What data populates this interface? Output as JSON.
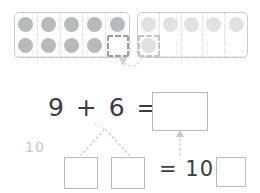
{
  "worksheet": {
    "title": "Make-a-ten strategy worksheet",
    "background_color": "#ffffff"
  },
  "colors": {
    "chip_dark": "#b7babd",
    "chip_light": "#dfe1e3",
    "frame_border": "#c9cccf",
    "grid_line": "#d7d9dc",
    "dashed_highlight": "#9b9ea1",
    "text": "#363b3e",
    "faint_label": "#c6c8cb",
    "connector": "#d2d4d7"
  },
  "ten_frames": [
    {
      "name": "left-ten-frame",
      "filled_count": 9,
      "capacity": 10,
      "chip_shade": "dark",
      "empty_cell_index": 9,
      "empty_cell_highlighted": true
    },
    {
      "name": "right-ten-frame",
      "filled_count": 6,
      "capacity": 10,
      "chip_shade": "light",
      "highlighted_chip_index": 5
    }
  ],
  "equation_main": {
    "addend_1": "9",
    "operator": "+",
    "addend_2": "6",
    "equals": "=",
    "text": "9 + 6 =",
    "sum_box_value": ""
  },
  "decomposition": {
    "ten_label": "10",
    "part_box_1_value": "",
    "part_box_2_value": "",
    "equals": "=",
    "ten": "10",
    "plus": "+",
    "remainder_box_value": "",
    "text": "= 10 +"
  },
  "connectors": [
    {
      "name": "move-chip-arrow",
      "style": "dotted",
      "direction": "down-right"
    },
    {
      "name": "sum-to-parts-branch",
      "style": "dotted",
      "direction": "branching"
    },
    {
      "name": "parts-to-sum-arrow",
      "style": "dotted",
      "direction": "up"
    }
  ]
}
